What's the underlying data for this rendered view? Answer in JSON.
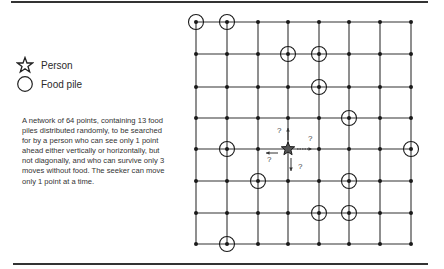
{
  "legend": {
    "items": [
      {
        "icon": "star-icon",
        "label": "Person"
      },
      {
        "icon": "circle-icon",
        "label": "Food pile"
      }
    ]
  },
  "caption": "A network of 64 points, containing 13 food piles distributed randomly, to be searched for by a person who can see only 1 point ahead either vertically or horizontally, but not diagonally, and who can survive only 3 moves without food. The seeker can move only 1 point at a time.",
  "grid": {
    "columns": 8,
    "rows": 8,
    "food_piles": [
      [
        0,
        0
      ],
      [
        1,
        0
      ],
      [
        3,
        1
      ],
      [
        4,
        1
      ],
      [
        4,
        2
      ],
      [
        5,
        3
      ],
      [
        1,
        4
      ],
      [
        7,
        4
      ],
      [
        2,
        5
      ],
      [
        5,
        5
      ],
      [
        4,
        6
      ],
      [
        5,
        6
      ],
      [
        1,
        7
      ]
    ],
    "person": [
      3,
      4
    ],
    "arrows": [
      {
        "direction": "up",
        "label": "?"
      },
      {
        "direction": "right",
        "label": "?"
      },
      {
        "direction": "left",
        "label": "?"
      },
      {
        "direction": "down",
        "label": "?"
      }
    ]
  },
  "colors": {
    "line": "#333333",
    "ink": "#1a1a1a"
  }
}
